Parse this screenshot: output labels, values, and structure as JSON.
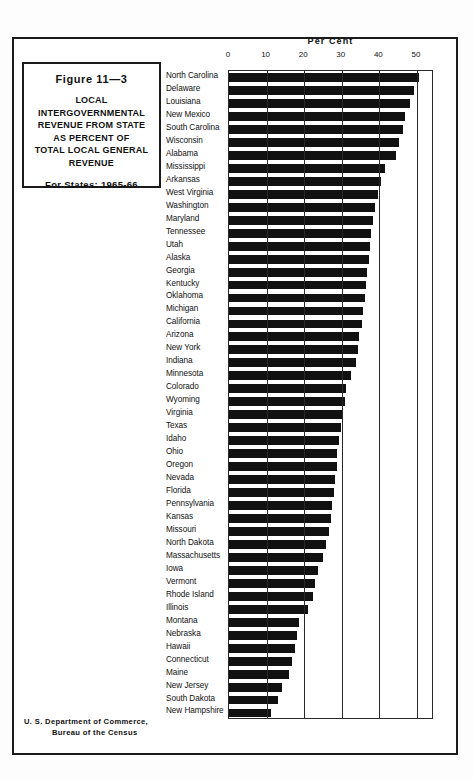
{
  "figure": {
    "number": "Figure 11—3",
    "title_lines": [
      "LOCAL",
      "INTERGOVERNMENTAL",
      "REVENUE FROM STATE",
      "AS PERCENT OF",
      "TOTAL LOCAL GENERAL",
      "REVENUE"
    ],
    "subtitle": "For States: 1965-66"
  },
  "footer": {
    "line1": "U. S. Department of Commerce,",
    "line2": "Bureau of the Census"
  },
  "chart_data": {
    "type": "bar",
    "orientation": "horizontal",
    "title": "LOCAL INTERGOVERNMENTAL REVENUE FROM STATE AS PERCENT OF TOTAL LOCAL GENERAL REVENUE",
    "subtitle": "For States: 1965-66",
    "xlabel": "Per Cent",
    "ylabel": "",
    "xlim": [
      0,
      54
    ],
    "axis_ticks": [
      0,
      10,
      20,
      30,
      40,
      50
    ],
    "tick_labels": [
      "0",
      "10",
      "20",
      "30",
      "40",
      "50"
    ],
    "grid": true,
    "legend": "none",
    "bar_color": "#111111",
    "categories": [
      "North Carolina",
      "Delaware",
      "Louisiana",
      "New Mexico",
      "South Carolina",
      "Wisconsin",
      "Alabama",
      "Mississippi",
      "Arkansas",
      "West Virginia",
      "Washington",
      "Maryland",
      "Tennessee",
      "Utah",
      "Alaska",
      "Georgia",
      "Kentucky",
      "Oklahoma",
      "Michigan",
      "California",
      "Arizona",
      "New York",
      "Indiana",
      "Minnesota",
      "Colorado",
      "Wyoming",
      "Virginia",
      "Texas",
      "Idaho",
      "Ohio",
      "Oregon",
      "Nevada",
      "Florida",
      "Pennsylvania",
      "Kansas",
      "Missouri",
      "North Dakota",
      "Massachusetts",
      "Iowa",
      "Vermont",
      "Rhode Island",
      "Illinois",
      "Montana",
      "Nebraska",
      "Hawaii",
      "Connecticut",
      "Maine",
      "New Jersey",
      "South Dakota",
      "New Hampshire"
    ],
    "values": [
      50.5,
      49.3,
      48.2,
      46.7,
      46.3,
      45.1,
      44.4,
      41.4,
      40.4,
      39.6,
      38.9,
      38.4,
      37.9,
      37.6,
      37.3,
      36.6,
      36.4,
      36.1,
      35.7,
      35.3,
      34.7,
      34.3,
      33.8,
      32.4,
      31.2,
      30.8,
      30.4,
      29.9,
      29.2,
      28.8,
      28.6,
      28.3,
      27.8,
      27.5,
      27.1,
      26.6,
      25.9,
      24.9,
      23.8,
      22.9,
      22.4,
      21.0,
      18.7,
      18.2,
      17.6,
      16.7,
      15.9,
      14.2,
      13.1,
      11.2
    ]
  }
}
